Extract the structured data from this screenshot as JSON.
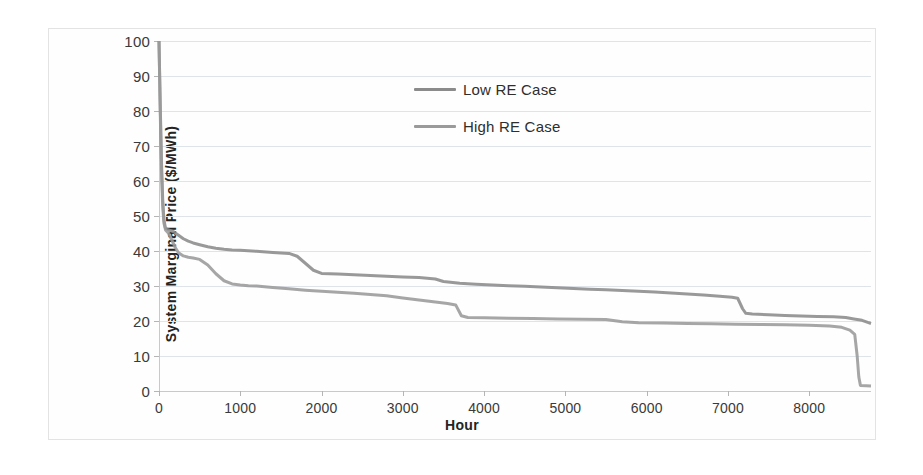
{
  "chart_data": {
    "type": "line",
    "title": "",
    "xlabel": "Hour",
    "ylabel": "System Marginal  Price ($/MWh)",
    "xlim": [
      0,
      8760
    ],
    "ylim": [
      0,
      100
    ],
    "xticks": [
      0,
      1000,
      2000,
      3000,
      4000,
      5000,
      6000,
      7000,
      8000
    ],
    "xtick_labels": [
      "0",
      "1000",
      "2000",
      "3000",
      "4000",
      "5000",
      "6000",
      "7000",
      "8000"
    ],
    "yticks": [
      0,
      10,
      20,
      30,
      40,
      50,
      60,
      70,
      80,
      90,
      100
    ],
    "ytick_labels": [
      "0",
      "10",
      "20",
      "30",
      "40",
      "50",
      "60",
      "70",
      "80",
      "90",
      "100"
    ],
    "grid": "horizontal",
    "legend_position": "upper-center",
    "series": [
      {
        "name": "Low RE Case",
        "color": "#8b8b8b",
        "points": [
          [
            0,
            100
          ],
          [
            15,
            82
          ],
          [
            30,
            66
          ],
          [
            45,
            55
          ],
          [
            60,
            49
          ],
          [
            80,
            46.5
          ],
          [
            120,
            46
          ],
          [
            180,
            45.5
          ],
          [
            240,
            44.5
          ],
          [
            300,
            43.5
          ],
          [
            360,
            42.8
          ],
          [
            420,
            42.3
          ],
          [
            500,
            41.8
          ],
          [
            600,
            41.2
          ],
          [
            700,
            40.8
          ],
          [
            800,
            40.5
          ],
          [
            900,
            40.3
          ],
          [
            1000,
            40.2
          ],
          [
            1200,
            39.9
          ],
          [
            1400,
            39.6
          ],
          [
            1600,
            39.3
          ],
          [
            1700,
            38.5
          ],
          [
            1800,
            36.5
          ],
          [
            1900,
            34.5
          ],
          [
            2000,
            33.6
          ],
          [
            2200,
            33.4
          ],
          [
            2400,
            33.2
          ],
          [
            2600,
            33.0
          ],
          [
            2800,
            32.8
          ],
          [
            3000,
            32.6
          ],
          [
            3200,
            32.4
          ],
          [
            3400,
            32.0
          ],
          [
            3500,
            31.3
          ],
          [
            3700,
            30.8
          ],
          [
            3900,
            30.5
          ],
          [
            4100,
            30.3
          ],
          [
            4300,
            30.1
          ],
          [
            4500,
            29.9
          ],
          [
            4700,
            29.7
          ],
          [
            4900,
            29.5
          ],
          [
            5100,
            29.3
          ],
          [
            5300,
            29.1
          ],
          [
            5500,
            28.9
          ],
          [
            5700,
            28.7
          ],
          [
            5900,
            28.5
          ],
          [
            6100,
            28.3
          ],
          [
            6300,
            28.0
          ],
          [
            6500,
            27.7
          ],
          [
            6700,
            27.4
          ],
          [
            6900,
            27.1
          ],
          [
            7050,
            26.8
          ],
          [
            7120,
            26.5
          ],
          [
            7180,
            23.5
          ],
          [
            7220,
            22.2
          ],
          [
            7300,
            22.0
          ],
          [
            7500,
            21.8
          ],
          [
            7700,
            21.6
          ],
          [
            7900,
            21.4
          ],
          [
            8100,
            21.3
          ],
          [
            8300,
            21.2
          ],
          [
            8450,
            21.0
          ],
          [
            8550,
            20.6
          ],
          [
            8650,
            20.2
          ],
          [
            8720,
            19.6
          ],
          [
            8760,
            19.3
          ]
        ]
      },
      {
        "name": "High RE Case",
        "color": "#9a9a9a",
        "points": [
          [
            0,
            100
          ],
          [
            15,
            80
          ],
          [
            30,
            63
          ],
          [
            45,
            53
          ],
          [
            60,
            48
          ],
          [
            80,
            46.0
          ],
          [
            120,
            45.0
          ],
          [
            160,
            43.0
          ],
          [
            200,
            41.0
          ],
          [
            240,
            39.5
          ],
          [
            300,
            38.6
          ],
          [
            360,
            38.2
          ],
          [
            420,
            38.0
          ],
          [
            500,
            37.6
          ],
          [
            600,
            36.0
          ],
          [
            700,
            33.5
          ],
          [
            800,
            31.5
          ],
          [
            900,
            30.6
          ],
          [
            1000,
            30.3
          ],
          [
            1100,
            30.1
          ],
          [
            1200,
            30.0
          ],
          [
            1400,
            29.6
          ],
          [
            1600,
            29.2
          ],
          [
            1800,
            28.8
          ],
          [
            2000,
            28.5
          ],
          [
            2200,
            28.2
          ],
          [
            2400,
            27.9
          ],
          [
            2600,
            27.6
          ],
          [
            2800,
            27.2
          ],
          [
            3000,
            26.6
          ],
          [
            3200,
            26.0
          ],
          [
            3400,
            25.4
          ],
          [
            3550,
            25.0
          ],
          [
            3650,
            24.6
          ],
          [
            3720,
            21.5
          ],
          [
            3800,
            21.0
          ],
          [
            4000,
            20.9
          ],
          [
            4300,
            20.8
          ],
          [
            4600,
            20.7
          ],
          [
            4900,
            20.6
          ],
          [
            5200,
            20.5
          ],
          [
            5500,
            20.4
          ],
          [
            5700,
            19.8
          ],
          [
            5900,
            19.5
          ],
          [
            6200,
            19.4
          ],
          [
            6500,
            19.3
          ],
          [
            6800,
            19.2
          ],
          [
            7100,
            19.1
          ],
          [
            7400,
            19.0
          ],
          [
            7700,
            18.9
          ],
          [
            8000,
            18.8
          ],
          [
            8250,
            18.6
          ],
          [
            8400,
            18.2
          ],
          [
            8500,
            17.4
          ],
          [
            8560,
            16.2
          ],
          [
            8590,
            10.0
          ],
          [
            8610,
            4.0
          ],
          [
            8630,
            1.6
          ],
          [
            8700,
            1.5
          ],
          [
            8760,
            1.4
          ]
        ]
      }
    ]
  },
  "legend": {
    "items": [
      {
        "label": "Low RE Case"
      },
      {
        "label": "High RE Case"
      }
    ]
  },
  "axes": {
    "y_title": "System Marginal  Price ($/MWh)",
    "x_title": "Hour"
  }
}
